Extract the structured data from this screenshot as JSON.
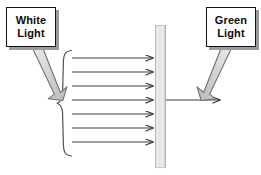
{
  "diagram": {
    "background_color": "#ffffff",
    "labels": {
      "white_light": {
        "line1": "White",
        "line2": "Light"
      },
      "green_light": {
        "line1": "Green",
        "line2": "Light"
      }
    },
    "filter": {
      "name": "green-filter-bar",
      "fill_color": "#e9e9e9",
      "edge_color": "#b6b6b6",
      "x": 155,
      "y": 25,
      "width": 11,
      "height": 143
    },
    "incoming_rays": {
      "name": "white-light-rays",
      "count": 7,
      "color": "#3c3c3c",
      "x_start": 72,
      "x_end": 157,
      "y_values": [
        58,
        72,
        86,
        100,
        114,
        128,
        142
      ]
    },
    "outgoing_ray": {
      "name": "green-light-ray",
      "color": "#3c3c3c",
      "x_start": 166,
      "x_end": 224,
      "y": 100
    },
    "brace": {
      "name": "ray-bundle-brace",
      "color": "#4a4a4a",
      "top": 50,
      "bottom": 160,
      "tip_x": 57,
      "right_x": 72
    },
    "block_arrows": [
      {
        "name": "white-light-block-arrow",
        "direction": "down-right",
        "fill_color": "#d4d4d4",
        "stroke_color": "#6e6e6e",
        "from": [
          36,
          47
        ],
        "to": [
          60,
          96
        ]
      },
      {
        "name": "green-light-block-arrow",
        "direction": "down-left",
        "fill_color": "#d4d4d4",
        "stroke_color": "#6e6e6e",
        "from": [
          228,
          47
        ],
        "to": [
          204,
          96
        ]
      }
    ]
  }
}
